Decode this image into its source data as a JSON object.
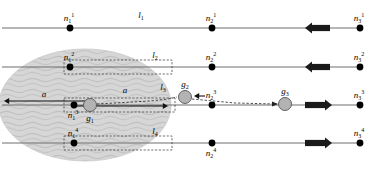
{
  "figure": {
    "type": "diagram",
    "width": 379,
    "height": 169,
    "background": "#ffffff"
  },
  "colors": {
    "line": "#6e6e6e",
    "node": "#000000",
    "block_arrow": "#1a1a1a",
    "blob_fill": "#d4d4d4",
    "blob_wave": "#c0c0c0",
    "glider_fill": "#b3b3b3",
    "glider_stroke": "#555555",
    "dashed": "#333333",
    "text": "#000000"
  },
  "rows": [
    {
      "id": "row-1",
      "y": 28,
      "arrow_direction": "left",
      "nodes": [
        {
          "name": "n-1-1",
          "x": 70,
          "label": "n",
          "sub": "1",
          "sup": "1",
          "label_pos": "above"
        },
        {
          "name": "n-2-1",
          "x": 212,
          "label": "n",
          "sub": "2",
          "sup": "1",
          "label_pos": "above"
        },
        {
          "name": "n-3-1",
          "x": 360,
          "label": "n",
          "sub": "3",
          "sup": "1",
          "label_pos": "above"
        }
      ],
      "span_label": {
        "name": "l-1",
        "label": "l",
        "sub": "1",
        "x": 141,
        "y": 18,
        "boxed": false
      }
    },
    {
      "id": "row-2",
      "y": 67,
      "arrow_direction": "left",
      "nodes": [
        {
          "name": "n-1-2",
          "x": 70,
          "label": "n",
          "sub": "1",
          "sup": "2",
          "label_pos": "above"
        },
        {
          "name": "n-2-2",
          "x": 212,
          "label": "n",
          "sub": "2",
          "sup": "2",
          "label_pos": "above"
        },
        {
          "name": "n-3-2",
          "x": 360,
          "label": "n",
          "sub": "3",
          "sup": "2",
          "label_pos": "above"
        }
      ],
      "span_label": {
        "name": "l-2",
        "label": "l",
        "sub": "2",
        "x": 155,
        "y": 58,
        "boxed": true
      },
      "measure_box": {
        "x1": 64,
        "x2": 172,
        "y1": 60,
        "y2": 74
      }
    },
    {
      "id": "row-3",
      "y": 105,
      "arrow_direction": "right",
      "nodes": [
        {
          "name": "n-1-3",
          "x": 74,
          "label": "n",
          "sub": "1",
          "sup": "3",
          "label_pos": "below"
        },
        {
          "name": "n-2-3",
          "x": 212,
          "label": "n",
          "sub": "2",
          "sup": "3",
          "label_pos": "above"
        },
        {
          "name": "n-3-3",
          "x": 360,
          "label": "n",
          "sub": "3",
          "sup": "3",
          "label_pos": "above"
        }
      ],
      "span_label": {
        "name": "l-3",
        "label": "l",
        "sub": "3",
        "x": 163,
        "y": 90,
        "boxed": true
      },
      "measure_box": {
        "x1": 64,
        "x2": 175,
        "y1": 98,
        "y2": 112
      }
    },
    {
      "id": "row-4",
      "y": 143,
      "arrow_direction": "right",
      "nodes": [
        {
          "name": "n-1-4",
          "x": 74,
          "label": "n",
          "sub": "1",
          "sup": "4",
          "label_pos": "above"
        },
        {
          "name": "n-2-4",
          "x": 212,
          "label": "n",
          "sub": "2",
          "sup": "4",
          "label_pos": "below"
        },
        {
          "name": "n-3-4",
          "x": 360,
          "label": "n",
          "sub": "3",
          "sup": "4",
          "label_pos": "above"
        }
      ],
      "span_label": {
        "name": "l-4",
        "label": "l",
        "sub": "4",
        "x": 155,
        "y": 134,
        "boxed": true
      },
      "measure_box": {
        "x1": 64,
        "x2": 172,
        "y1": 136,
        "y2": 150
      }
    }
  ],
  "gliders": [
    {
      "name": "g-1",
      "x": 90,
      "y": 105,
      "r": 6.5,
      "label": "g",
      "sub": "1",
      "label_pos": "below"
    },
    {
      "name": "g-2",
      "x": 185,
      "y": 97,
      "r": 6.5,
      "label": "g",
      "sub": "2",
      "label_pos": "above"
    },
    {
      "name": "g-3",
      "x": 285,
      "y": 104,
      "r": 6.5,
      "label": "g",
      "sub": "3",
      "label_pos": "above"
    }
  ],
  "acceleration_labels": [
    {
      "name": "a-left",
      "label": "a",
      "x": 44,
      "y": 97
    },
    {
      "name": "a-right",
      "label": "a",
      "x": 125,
      "y": 93
    }
  ],
  "block_arrows": [
    {
      "name": "block-arrow-row-1",
      "row": 1,
      "x_tail": 330,
      "x_head": 305,
      "y": 28,
      "direction": "left"
    },
    {
      "name": "block-arrow-row-2",
      "row": 2,
      "x_tail": 330,
      "x_head": 305,
      "y": 67,
      "direction": "left"
    },
    {
      "name": "block-arrow-row-3",
      "row": 3,
      "x_tail": 305,
      "x_head": 332,
      "y": 105,
      "direction": "right"
    },
    {
      "name": "block-arrow-row-4",
      "row": 4,
      "x_tail": 305,
      "x_head": 332,
      "y": 143,
      "direction": "right"
    }
  ],
  "region": {
    "name": "shaded-region",
    "cx": 85,
    "cy": 105,
    "rx": 86,
    "ry": 56,
    "fill": "#d4d4d4",
    "texture": "wavy"
  },
  "track_extent": {
    "x_start": 2,
    "x_end": 362
  }
}
